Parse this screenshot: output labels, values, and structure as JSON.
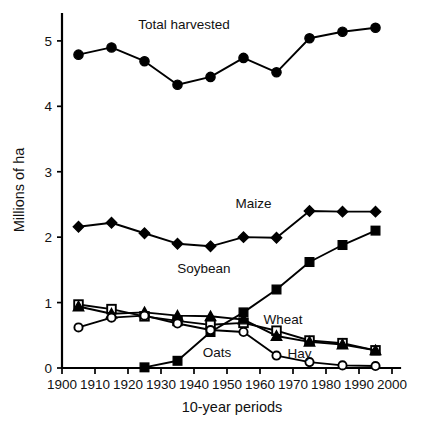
{
  "chart_data": {
    "type": "line",
    "title": "",
    "xlabel": "10-year periods",
    "ylabel": "Millions of ha",
    "xlim": [
      1900,
      2000
    ],
    "ylim": [
      0,
      5.35
    ],
    "xticks": [
      1900,
      1910,
      1920,
      1930,
      1940,
      1950,
      1960,
      1970,
      1980,
      1990,
      2000
    ],
    "yticks": [
      0,
      1,
      2,
      3,
      4,
      5
    ],
    "grid": false,
    "legend_position": "inline-annotations",
    "x": [
      1905,
      1915,
      1925,
      1935,
      1945,
      1955,
      1965,
      1975,
      1985,
      1995
    ],
    "series": [
      {
        "name": "Total harvested",
        "marker": "filled-circle",
        "label": "Total harvested",
        "values": [
          4.79,
          4.9,
          4.69,
          4.33,
          4.45,
          4.74,
          4.52,
          5.04,
          5.14,
          5.2
        ]
      },
      {
        "name": "Maize",
        "marker": "filled-diamond",
        "label": "Maize",
        "values": [
          2.16,
          2.22,
          2.06,
          1.9,
          1.86,
          2.0,
          1.99,
          2.4,
          2.39,
          2.39
        ]
      },
      {
        "name": "Soybean",
        "marker": "filled-square",
        "label": "Soybean",
        "values": [
          null,
          null,
          0.01,
          0.11,
          0.55,
          0.85,
          1.2,
          1.62,
          1.88,
          2.1
        ]
      },
      {
        "name": "Wheat",
        "marker": "open-square",
        "label": "Wheat",
        "values": [
          0.97,
          0.9,
          0.79,
          0.72,
          0.66,
          0.69,
          0.57,
          0.42,
          0.38,
          0.27
        ]
      },
      {
        "name": "Hay",
        "marker": "filled-triangle",
        "label": "Hay",
        "values": [
          0.94,
          0.83,
          0.85,
          0.8,
          0.79,
          0.74,
          0.49,
          0.4,
          0.36,
          0.27
        ]
      },
      {
        "name": "Oats",
        "marker": "open-circle",
        "label": "Oats",
        "values": [
          0.62,
          0.77,
          0.8,
          0.68,
          0.58,
          0.55,
          0.19,
          0.09,
          0.04,
          0.03
        ]
      }
    ],
    "annotations": [
      {
        "text": "Total harvested",
        "x": 1937,
        "y": 5.18
      },
      {
        "text": "Maize",
        "x": 1958,
        "y": 2.45
      },
      {
        "text": "Soybean",
        "x": 1943,
        "y": 1.45
      },
      {
        "text": "Wheat",
        "x": 1967,
        "y": 0.68
      },
      {
        "text": "Oats",
        "x": 1947,
        "y": 0.17
      },
      {
        "text": "Hay",
        "x": 1972,
        "y": 0.16
      }
    ]
  }
}
